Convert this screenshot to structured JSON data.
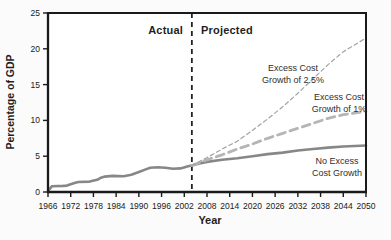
{
  "figure": {
    "y_axis_title": "Percentage of GDP",
    "x_axis_title": "Year",
    "actual_region_label": "Actual",
    "projected_region_label": "Projected"
  },
  "curve_labels": {
    "excess25_line1": "Excess Cost",
    "excess25_line2": "Growth of 2.5%",
    "excess1_line1": "Excess Cost",
    "excess1_line2": "Growth of 1%",
    "noexcess_line1": "No Excess",
    "noexcess_line2": "Cost Growth"
  },
  "colors": {
    "axis": "#1a1a1a",
    "tick_text": "#1a1a1a",
    "background": "#fbfbfb",
    "solid_line": "#878787",
    "dash_1pct_line": "#b5b5b5",
    "dash_25pct_line": "#a3a3a3",
    "divider": "#222222"
  },
  "chart_data": {
    "type": "line",
    "title": "",
    "xlabel": "Year",
    "ylabel": "Percentage of GDP",
    "xlim": [
      1966,
      2050
    ],
    "ylim": [
      0,
      25
    ],
    "grid": false,
    "legend_position": "inline-labels",
    "x_ticks": [
      1966,
      1972,
      1978,
      1984,
      1990,
      1996,
      2002,
      2008,
      2014,
      2020,
      2026,
      2032,
      2038,
      2044,
      2050
    ],
    "y_ticks": [
      0,
      5,
      10,
      15,
      20,
      25
    ],
    "divider_year": 2004,
    "series": [
      {
        "name": "actual-spending",
        "label": "Actual",
        "color": "#878787",
        "width": 2.6,
        "dash": null,
        "points": [
          [
            1966,
            0.15
          ],
          [
            1967,
            0.8
          ],
          [
            1970,
            0.85
          ],
          [
            1971,
            0.9
          ],
          [
            1973,
            1.25
          ],
          [
            1974,
            1.4
          ],
          [
            1977,
            1.45
          ],
          [
            1979,
            1.7
          ],
          [
            1980,
            2.0
          ],
          [
            1981,
            2.15
          ],
          [
            1983,
            2.25
          ],
          [
            1986,
            2.2
          ],
          [
            1988,
            2.4
          ],
          [
            1990,
            2.8
          ],
          [
            1992,
            3.2
          ],
          [
            1993,
            3.4
          ],
          [
            1995,
            3.45
          ],
          [
            1997,
            3.4
          ],
          [
            1999,
            3.25
          ],
          [
            2001,
            3.3
          ],
          [
            2003,
            3.6
          ],
          [
            2004,
            3.7
          ]
        ]
      },
      {
        "name": "no-excess-cost-growth",
        "label": "No Excess Cost Growth",
        "color": "#878787",
        "width": 2.6,
        "dash": null,
        "points": [
          [
            2004,
            3.7
          ],
          [
            2006,
            4.0
          ],
          [
            2008,
            4.2
          ],
          [
            2012,
            4.5
          ],
          [
            2016,
            4.7
          ],
          [
            2020,
            5.0
          ],
          [
            2024,
            5.3
          ],
          [
            2028,
            5.5
          ],
          [
            2032,
            5.8
          ],
          [
            2036,
            6.0
          ],
          [
            2040,
            6.2
          ],
          [
            2044,
            6.35
          ],
          [
            2050,
            6.5
          ]
        ]
      },
      {
        "name": "excess-cost-growth-1pct",
        "label": "Excess Cost Growth of 1%",
        "color": "#b5b5b5",
        "width": 2.8,
        "dash": "8 5",
        "points": [
          [
            2004,
            3.7
          ],
          [
            2008,
            4.5
          ],
          [
            2012,
            5.2
          ],
          [
            2016,
            6.0
          ],
          [
            2020,
            6.7
          ],
          [
            2024,
            7.5
          ],
          [
            2028,
            8.2
          ],
          [
            2032,
            8.9
          ],
          [
            2036,
            9.6
          ],
          [
            2040,
            10.3
          ],
          [
            2044,
            10.8
          ],
          [
            2050,
            11.3
          ]
        ]
      },
      {
        "name": "excess-cost-growth-2.5pct",
        "label": "Excess Cost Growth of 2.5%",
        "color": "#a3a3a3",
        "width": 1.2,
        "dash": "4 3",
        "points": [
          [
            2004,
            3.7
          ],
          [
            2008,
            4.8
          ],
          [
            2012,
            6.0
          ],
          [
            2016,
            7.1
          ],
          [
            2020,
            8.6
          ],
          [
            2024,
            10.2
          ],
          [
            2028,
            11.9
          ],
          [
            2032,
            13.8
          ],
          [
            2036,
            15.8
          ],
          [
            2040,
            17.8
          ],
          [
            2044,
            19.6
          ],
          [
            2050,
            21.5
          ]
        ]
      }
    ]
  }
}
